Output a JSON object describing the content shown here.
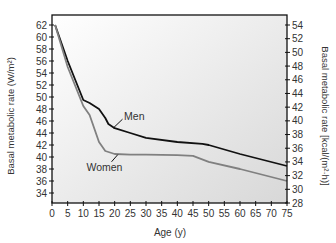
{
  "chart_data": {
    "type": "line",
    "title": "",
    "xlabel": "Age (y)",
    "ylabel": "Basal metabolic rate (W/m²)",
    "ylabel_right": "Basal metabolic rate [kcal/(m²·h)]",
    "xlim": [
      0,
      75
    ],
    "ylim": [
      32,
      63
    ],
    "ylim_right": [
      28,
      54
    ],
    "x_ticks": [
      0,
      5,
      10,
      15,
      20,
      25,
      30,
      35,
      40,
      45,
      50,
      55,
      60,
      65,
      70,
      75
    ],
    "y_ticks": [
      34,
      36,
      38,
      40,
      42,
      44,
      46,
      48,
      50,
      52,
      54,
      56,
      58,
      60,
      62
    ],
    "y_ticks_right": [
      28,
      30,
      32,
      34,
      36,
      38,
      40,
      42,
      44,
      46,
      48,
      50,
      52,
      54
    ],
    "grid": false,
    "legend": "inline labels",
    "series": [
      {
        "name": "Men",
        "color": "#111111",
        "x": [
          1,
          5,
          10,
          12,
          15,
          17,
          18,
          20,
          25,
          30,
          40,
          48,
          50,
          60,
          75
        ],
        "values": [
          62,
          56,
          49.5,
          49,
          48,
          46.5,
          45.5,
          44.8,
          44,
          43.2,
          42.5,
          42.2,
          42,
          40.5,
          38.5
        ]
      },
      {
        "name": "Women",
        "color": "#808080",
        "x": [
          1,
          5,
          10,
          12,
          15,
          17,
          20,
          25,
          30,
          40,
          45,
          50,
          60,
          75
        ],
        "values": [
          62,
          55,
          48.5,
          47,
          42.5,
          41,
          40.5,
          40.4,
          40.4,
          40.3,
          40.2,
          39.2,
          38,
          36
        ]
      }
    ],
    "annotations": [
      {
        "text": "Men",
        "x": 22,
        "y": 46.5
      },
      {
        "text": "Women",
        "x": 17,
        "y": 38
      }
    ]
  }
}
